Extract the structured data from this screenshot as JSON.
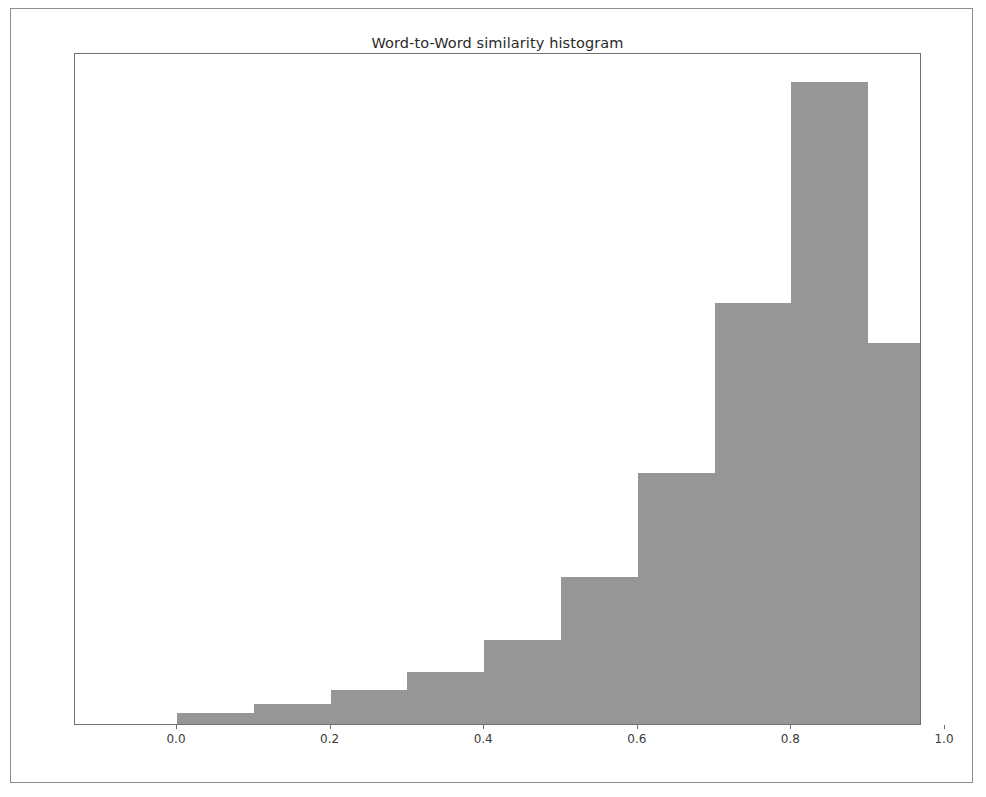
{
  "figure": {
    "title": "Word-to-Word similarity histogram",
    "bar_color": "#969696",
    "axes_color": "#6f6f6f",
    "background": "#ffffff"
  },
  "xaxis": {
    "ticks": [
      "0.0",
      "0.2",
      "0.4",
      "0.6",
      "0.8",
      "1.0"
    ],
    "tick_values": [
      0.0,
      0.2,
      0.4,
      0.6,
      0.8,
      1.0
    ],
    "label": ""
  },
  "yaxis": {
    "ticks": [],
    "label": ""
  },
  "chart_data": {
    "type": "bar",
    "title": "Word-to-Word similarity histogram",
    "xlabel": "",
    "ylabel": "",
    "xlim": [
      -0.05,
      1.05
    ],
    "ylim": [
      0,
      1.0
    ],
    "grid": false,
    "legend": null,
    "bin_edges": [
      0.0,
      0.1,
      0.2,
      0.3,
      0.4,
      0.5,
      0.6,
      0.7,
      0.8,
      0.9,
      1.0
    ],
    "categories": [
      "0.0-0.1",
      "0.1-0.2",
      "0.2-0.3",
      "0.3-0.4",
      "0.4-0.5",
      "0.5-0.6",
      "0.6-0.7",
      "0.7-0.8",
      "0.8-0.9",
      "0.9-1.0"
    ],
    "values": [
      0.016,
      0.03,
      0.051,
      0.077,
      0.125,
      0.219,
      0.373,
      0.626,
      0.955,
      0.567
    ],
    "bar_pixel_heights": [
      11,
      20,
      34,
      52,
      84,
      147,
      251,
      421,
      642,
      381
    ],
    "bar_tops_px": [
      713,
      704,
      690,
      672,
      640,
      577,
      473,
      303,
      82,
      343
    ]
  }
}
